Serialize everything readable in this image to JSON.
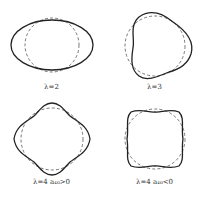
{
  "figure": {
    "panels": [
      {
        "id": "l2",
        "label": "λ=2",
        "lambda": 2,
        "shape": "oblate ellipsoid"
      },
      {
        "id": "l3",
        "label": "λ=3",
        "lambda": 3,
        "shape": "triangular (octupole)"
      },
      {
        "id": "l4a",
        "label": "λ=4  a₄₀>0",
        "lambda": 4,
        "shape": "diamond (hexadecapole)"
      },
      {
        "id": "l4b",
        "label": "λ=4  a₄₀<0",
        "lambda": 4,
        "shape": "square (hexadecapole)"
      }
    ],
    "legend": {
      "solid": "deformed surface",
      "dashed": "spherical reference"
    },
    "colors": {
      "line": "#222222",
      "dashed": "#555555",
      "background": "#ffffff"
    }
  }
}
